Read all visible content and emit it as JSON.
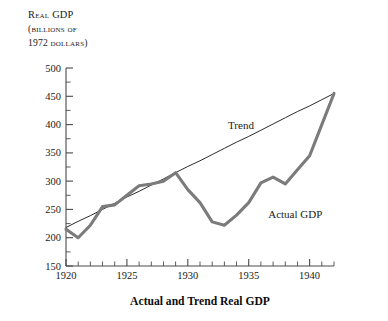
{
  "chart_data": {
    "type": "line",
    "title": "Actual and Trend Real GDP",
    "xlabel": "",
    "ylabel": "Real GDP (billions of 1972 dollars)",
    "ylabel_lines": [
      "Real GDP",
      "(billions of",
      "1972 dollars)"
    ],
    "xlim": [
      1920,
      1942
    ],
    "ylim": [
      150,
      500
    ],
    "y_ticks_major": [
      150,
      200,
      250,
      300,
      350,
      400,
      450,
      500
    ],
    "y_ticks_minor": [
      175,
      225,
      275,
      325,
      375,
      425,
      475
    ],
    "x_ticks_labeled": [
      1920,
      1925,
      1930,
      1935,
      1940
    ],
    "x_ticks_all": [
      1920,
      1921,
      1922,
      1923,
      1924,
      1925,
      1926,
      1927,
      1928,
      1929,
      1930,
      1931,
      1932,
      1933,
      1934,
      1935,
      1936,
      1937,
      1938,
      1939,
      1940,
      1941,
      1942
    ],
    "grid": false,
    "legend": "inline-annotations",
    "x": [
      1920,
      1921,
      1922,
      1923,
      1924,
      1925,
      1926,
      1927,
      1928,
      1929,
      1930,
      1931,
      1932,
      1933,
      1934,
      1935,
      1936,
      1937,
      1938,
      1939,
      1940,
      1941,
      1942
    ],
    "series": [
      {
        "name": "Actual GDP",
        "color": "#7b7b7b",
        "annotation": "Actual GDP",
        "values": [
          215,
          200,
          222,
          255,
          258,
          275,
          292,
          295,
          300,
          315,
          285,
          262,
          228,
          222,
          240,
          262,
          297,
          307,
          295,
          320,
          345,
          400,
          455
        ]
      },
      {
        "name": "Trend",
        "color": "#2b2b2b",
        "annotation": "Trend",
        "values": [
          218,
          229,
          239,
          250,
          261,
          272,
          282,
          293,
          304,
          315,
          326,
          336,
          347,
          358,
          369,
          379,
          390,
          401,
          412,
          423,
          433,
          444,
          455
        ]
      }
    ],
    "annotations": [
      {
        "text": "Trend",
        "x": 1933.3,
        "y": 393
      },
      {
        "text": "Actual GDP",
        "x": 1936.6,
        "y": 235
      }
    ]
  },
  "axis": {
    "y_title_line1": "Real GDP",
    "y_title_line2": "(billions of",
    "y_title_line3": "1972 dollars)",
    "y_500": "500",
    "y_450": "450",
    "y_400": "400",
    "y_350": "350",
    "y_300": "300",
    "y_250": "250",
    "y_200": "200",
    "y_150": "150",
    "x_1920": "1920",
    "x_1925": "1925",
    "x_1930": "1930",
    "x_1935": "1935",
    "x_1940": "1940"
  },
  "labels": {
    "chart_title": "Actual and Trend Real GDP",
    "trend": "Trend",
    "actual": "Actual GDP"
  },
  "colors": {
    "actual": "#7b7b7b",
    "trend": "#2b2b2b",
    "axis": "#4a4a4a",
    "background": "#ffffff"
  }
}
